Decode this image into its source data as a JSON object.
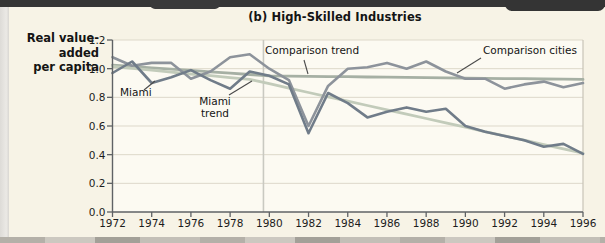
{
  "figure": {
    "title": "(b) High-Skilled Industries",
    "ylabel_lines": [
      "Real value-",
      "added",
      "per capita"
    ]
  },
  "chart_data": {
    "type": "line",
    "title": "(b) High-Skilled Industries",
    "ylabel": "Real value-added per capita",
    "xlabel": "",
    "xlim": [
      1972,
      1996
    ],
    "ylim": [
      0.0,
      1.2
    ],
    "grid": "horizontal",
    "legend_position": "inline-annotations",
    "reference_line_x": 1979.7,
    "x": [
      1972,
      1973,
      1974,
      1975,
      1976,
      1977,
      1978,
      1979,
      1980,
      1981,
      1982,
      1983,
      1984,
      1985,
      1986,
      1987,
      1988,
      1989,
      1990,
      1991,
      1992,
      1993,
      1994,
      1995,
      1996
    ],
    "xtick_labels": [
      "1972",
      "1974",
      "1976",
      "1978",
      "1980",
      "1982",
      "1984",
      "1986",
      "1988",
      "1990",
      "1992",
      "1994",
      "1996"
    ],
    "xticks": [
      1972,
      1974,
      1976,
      1978,
      1980,
      1982,
      1984,
      1986,
      1988,
      1990,
      1992,
      1994,
      1996
    ],
    "ytick_labels": [
      "0.0",
      "0.2",
      "0.4",
      "0.6",
      "0.8",
      "1.0",
      "1.2"
    ],
    "yticks": [
      0.0,
      0.2,
      0.4,
      0.6,
      0.8,
      1.0,
      1.2
    ],
    "series": [
      {
        "name": "Comparison trend",
        "color": "#a6b0a4",
        "width": 2.8,
        "values": [
          1.025,
          1.016,
          1.006,
          0.997,
          0.988,
          0.978,
          0.969,
          0.959,
          0.95,
          0.948,
          0.947,
          0.945,
          0.944,
          0.942,
          0.941,
          0.939,
          0.938,
          0.936,
          0.934,
          0.933,
          0.931,
          0.93,
          0.928,
          0.927,
          0.925
        ]
      },
      {
        "name": "Miami trend",
        "color": "#c2cbba",
        "width": 2.8,
        "values": [
          1.015,
          1.002,
          0.989,
          0.976,
          0.963,
          0.951,
          0.938,
          0.925,
          0.895,
          0.864,
          0.834,
          0.804,
          0.774,
          0.743,
          0.713,
          0.683,
          0.652,
          0.622,
          0.592,
          0.561,
          0.531,
          0.501,
          0.47,
          0.44,
          0.41
        ]
      },
      {
        "name": "Comparison cities",
        "color": "#8d939b",
        "width": 2.6,
        "values": [
          1.08,
          1.02,
          1.04,
          1.04,
          0.93,
          0.98,
          1.08,
          1.1,
          1.0,
          0.92,
          0.6,
          0.88,
          1.0,
          1.01,
          1.04,
          1.0,
          1.05,
          0.98,
          0.93,
          0.93,
          0.86,
          0.89,
          0.91,
          0.87,
          0.9
        ]
      },
      {
        "name": "Miami",
        "color": "#707c89",
        "width": 2.6,
        "values": [
          0.97,
          1.05,
          0.9,
          0.94,
          0.99,
          0.92,
          0.86,
          0.98,
          0.95,
          0.89,
          0.55,
          0.83,
          0.76,
          0.66,
          0.7,
          0.73,
          0.7,
          0.72,
          0.6,
          0.56,
          0.53,
          0.5,
          0.455,
          0.475,
          0.405
        ]
      }
    ],
    "annotations": [
      {
        "text": "Miami",
        "x": 120,
        "y": 87,
        "w": 40,
        "align": "left",
        "leader": [
          144,
          90,
          155,
          81
        ]
      },
      {
        "text": "Miami\ntrend",
        "x": 193,
        "y": 96,
        "w": 44,
        "align": "center",
        "leader": [
          229,
          95,
          252,
          81
        ]
      },
      {
        "text": "Comparison trend",
        "x": 265,
        "y": 45,
        "w": 96,
        "align": "left",
        "leader": [
          304,
          60,
          308,
          74
        ]
      },
      {
        "text": "Comparison cities",
        "x": 483,
        "y": 45,
        "w": 96,
        "align": "left",
        "leader": [
          481,
          58,
          457,
          73
        ]
      }
    ]
  },
  "colors": {
    "page_bg": "#f7f3e6",
    "plot_bg": "#fcfaf2",
    "grid": "#ddd8ca",
    "plot_border": "#c8c4b8",
    "reference_line": "#c9c9c1",
    "axis": "#5f6265",
    "leader": "#4a4a4a",
    "top_band": "#353535"
  }
}
